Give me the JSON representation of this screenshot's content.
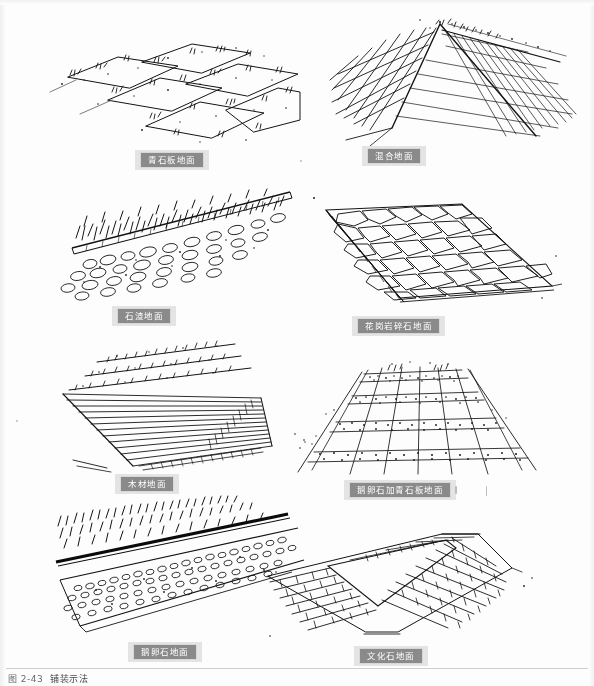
{
  "page": {
    "kind": "scanned-book-page",
    "background_color": "#fdfdfd",
    "ink_color": "#141414",
    "label_chip_color": "#8a8a8a",
    "label_text_color": "#ffffff",
    "width": 594,
    "height": 686
  },
  "figure_caption": {
    "number": "图 2-43",
    "text": "铺装示法"
  },
  "figures": [
    {
      "id": "bluestone-slab",
      "label": "青石板地面",
      "sketch_type": "perspective-line-drawing",
      "description": "large rectangular bluestone slabs laid in a receding grid with grass tufts in the joints",
      "row": 1,
      "column": 1
    },
    {
      "id": "mixed-paving",
      "label": "混合地面",
      "sketch_type": "perspective-line-drawing",
      "description": "two paving patterns meeting along a diagonal seam, square grid on the left and fine hatched grid on the right",
      "row": 1,
      "column": 2
    },
    {
      "id": "gravel-ground",
      "label": "石渣地面",
      "sketch_type": "perspective-line-drawing",
      "description": "grass and shrub mass above a straight edging strip with loose gravel and cobbles spread below",
      "row": 2,
      "column": 1
    },
    {
      "id": "granite-crushed-stone",
      "label": "花岗岩碎石地面",
      "sketch_type": "perspective-line-drawing",
      "description": "field of irregular polygonal granite flagstones with a shaded kerb along the left edge",
      "row": 2,
      "column": 2
    },
    {
      "id": "timber-decking",
      "label": "木材地面",
      "sketch_type": "perspective-line-drawing",
      "description": "closely spaced parallel timber deck planks receding to the right with a shaded fascia board",
      "row": 3,
      "column": 1
    },
    {
      "id": "pebble-with-bluestone",
      "label": "鹅卵石加青石板地面",
      "sketch_type": "perspective-line-drawing",
      "description": "alternating bands of stippled pebble infill and smooth bluestone slabs crossed by perspective joint lines",
      "row": 3,
      "column": 2
    },
    {
      "id": "pebble-ground",
      "label": "鹅卵石地面",
      "sketch_type": "perspective-line-drawing",
      "description": "a grass band above a solid dark edge line with a wide stippled pebble path band running diagonally below",
      "row": 4,
      "column": 1
    },
    {
      "id": "cultured-stone",
      "label": "文化石地面",
      "sketch_type": "perspective-line-drawing",
      "description": "running-bond brick-like cultured stone paving wrapping around a V shaped corner",
      "row": 4,
      "column": 2
    }
  ]
}
